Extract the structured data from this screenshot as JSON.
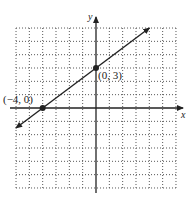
{
  "chart_data": {
    "type": "line",
    "title": "",
    "xlabel": "x",
    "ylabel": "y",
    "xlim": [
      -6,
      6
    ],
    "ylim": [
      -6,
      6
    ],
    "grid": true,
    "grid_style": "dotted",
    "series": [
      {
        "name": "line",
        "equation": "y = 3/4 x + 3",
        "x": [
          -6,
          4
        ],
        "y": [
          -1.5,
          6
        ],
        "arrows": "both"
      }
    ],
    "points": [
      {
        "x": -4,
        "y": 0,
        "label": "(−4, 0)"
      },
      {
        "x": 0,
        "y": 3,
        "label": "(0, 3)"
      }
    ]
  },
  "labels": {
    "x_axis": "x",
    "y_axis": "y",
    "point_a": "(−4, 0)",
    "point_b": "(0, 3)"
  },
  "colors": {
    "line": "#222222",
    "grid": "#555555",
    "background": "#ffffff"
  }
}
